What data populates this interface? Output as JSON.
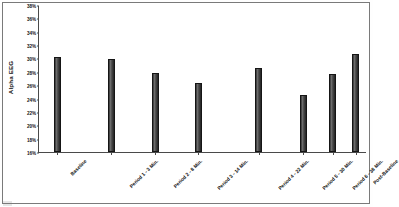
{
  "chart_data": {
    "type": "bar",
    "title": "None of the recording periods was significantly lower than the baselines.",
    "xlabel": "",
    "ylabel": "Alpha EEG",
    "ylim": [
      16,
      38
    ],
    "ytick_step": 2,
    "ytick_labels": [
      "38%",
      "36%",
      "34%",
      "32%",
      "30%",
      "28%",
      "26%",
      "24%",
      "22%",
      "20%",
      "18%",
      "16%"
    ],
    "ytick_values": [
      38,
      36,
      34,
      32,
      30,
      28,
      26,
      24,
      22,
      20,
      18,
      16
    ],
    "grid": false,
    "legend": false,
    "units": "%",
    "categories": [
      "Baseline",
      "Period 1 - 3 Min.",
      "Period 2 - 8 Min.",
      "Period 3 - 14 Min.",
      "Period 4 - 22 Min.",
      "Period 5 - 30 Min.",
      "Period 6 - 38 Min.",
      "Post-Baseline"
    ],
    "values": [
      30.2,
      29.9,
      27.8,
      26.4,
      28.6,
      24.6,
      27.7,
      30.6
    ],
    "bar_color": "#333333",
    "bar_positions_pct": [
      5.5,
      22.0,
      35.5,
      48.5,
      67.0,
      80.5,
      89.5,
      96.5
    ]
  }
}
